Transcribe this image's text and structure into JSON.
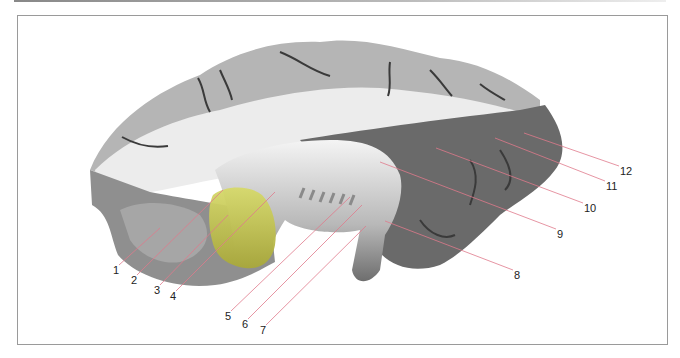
{
  "figure": {
    "type": "anatomical-illustration",
    "highlight_color": "#c8cb4a",
    "leader_line_color": "#e07a8c",
    "labels": [
      {
        "id": 1,
        "text": "1",
        "x": 113,
        "y": 265
      },
      {
        "id": 2,
        "text": "2",
        "x": 131,
        "y": 275
      },
      {
        "id": 3,
        "text": "3",
        "x": 154,
        "y": 285
      },
      {
        "id": 4,
        "text": "4",
        "x": 170,
        "y": 291
      },
      {
        "id": 5,
        "text": "5",
        "x": 225,
        "y": 311
      },
      {
        "id": 6,
        "text": "6",
        "x": 242,
        "y": 319
      },
      {
        "id": 7,
        "text": "7",
        "x": 260,
        "y": 325
      },
      {
        "id": 8,
        "text": "8",
        "x": 514,
        "y": 270
      },
      {
        "id": 9,
        "text": "9",
        "x": 557,
        "y": 229
      },
      {
        "id": 10,
        "text": "10",
        "x": 584,
        "y": 203
      },
      {
        "id": 11,
        "text": "11",
        "x": 606,
        "y": 181
      },
      {
        "id": 12,
        "text": "12",
        "x": 620,
        "y": 166
      }
    ]
  }
}
